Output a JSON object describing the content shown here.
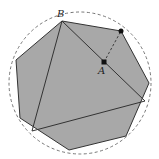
{
  "diagram": {
    "type": "geometry",
    "labels": {
      "B": "B",
      "A": "A"
    },
    "colors": {
      "fill": "#a8a8a8",
      "stroke": "#333333",
      "dashed_circle": "#666666",
      "point": "#111111"
    },
    "shapes": {
      "circumcircle": {
        "cx": 80,
        "cy": 83,
        "r": 71,
        "style": "dashed"
      },
      "heptagon": [
        [
          62,
          21
        ],
        [
          121,
          31
        ],
        [
          149,
          83
        ],
        [
          126,
          136
        ],
        [
          69,
          150
        ],
        [
          20,
          118
        ],
        [
          16,
          60
        ]
      ],
      "triangle": [
        [
          62,
          21
        ],
        [
          145,
          101
        ],
        [
          32,
          131
        ]
      ],
      "segment_A_to_edge": {
        "from": [
          104,
          62
        ],
        "to": [
          121,
          31
        ],
        "style": "dashed"
      },
      "points": {
        "A": [
          104,
          62
        ],
        "edge_point": [
          121,
          31
        ]
      }
    }
  }
}
